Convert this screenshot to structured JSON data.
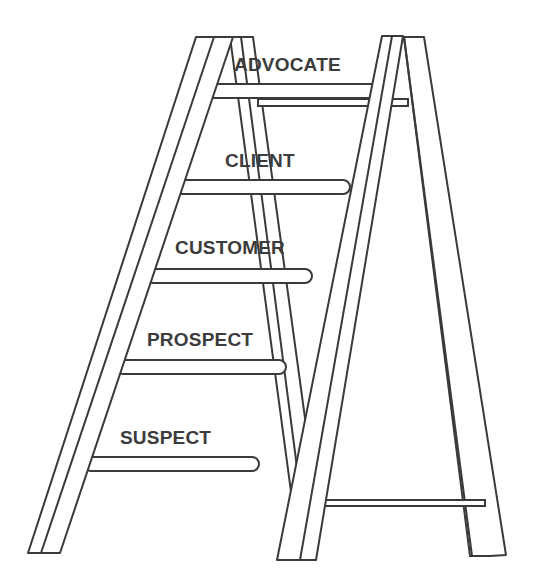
{
  "diagram": {
    "type": "ladder",
    "stroke_color": "#3a3a3a",
    "text_color": "#3c3c3c",
    "rungs": [
      {
        "label": "ADVOCATE",
        "level": 5
      },
      {
        "label": "CLIENT",
        "level": 4
      },
      {
        "label": "CUSTOMER",
        "level": 3
      },
      {
        "label": "PROSPECT",
        "level": 2
      },
      {
        "label": "SUSPECT",
        "level": 1
      }
    ]
  }
}
